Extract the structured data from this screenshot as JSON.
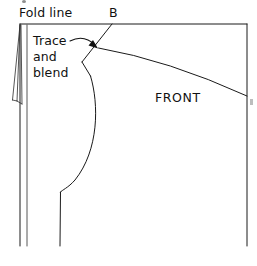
{
  "diagram": {
    "kind": "sewing-pattern-line-drawing",
    "canvas": {
      "width": 257,
      "height": 266,
      "background": "#ffffff"
    },
    "ink_color": "#1a1a1a"
  },
  "labels": {
    "fold_line": "Fold line",
    "point_b": "B",
    "trace_and_blend": "Trace\nand\nblend",
    "trace_and_blend_lines": [
      "Trace",
      "and",
      "blend"
    ],
    "front": "FRONT"
  },
  "annotations": {
    "arrow": {
      "name": "curved-arrow-to-point-b",
      "from": [
        70,
        41
      ],
      "to": [
        98,
        48
      ],
      "style": "curved-with-arrowhead"
    }
  },
  "geometry": {
    "top_edge": {
      "from": [
        20,
        24
      ],
      "to": [
        247,
        24
      ]
    },
    "right_edge": {
      "from": [
        247,
        24
      ],
      "to": [
        247,
        246
      ]
    },
    "fold_edge_outer": {
      "from": [
        20,
        24
      ],
      "to": [
        20,
        246
      ]
    },
    "fold_edge_inner": {
      "from": [
        27,
        24
      ],
      "to": [
        27,
        246
      ]
    },
    "dart_wedge": {
      "apex": [
        20,
        24
      ],
      "spread_bottom_left": [
        13,
        100
      ],
      "spread_bottom_right": [
        24,
        104
      ]
    },
    "point_b": [
      112,
      24
    ],
    "shoulder_seam": {
      "from": [
        112,
        24
      ],
      "to": [
        82,
        62
      ]
    },
    "neck_step": {
      "from": [
        82,
        62
      ],
      "to": [
        90,
        76
      ]
    },
    "armhole_curve": {
      "from": [
        99,
        48
      ],
      "control": [
        160,
        62
      ],
      "to": [
        247,
        96
      ]
    },
    "side_seam_curve": {
      "from": [
        90,
        76
      ],
      "bulge": [
        97,
        128
      ],
      "to": [
        60,
        192
      ]
    },
    "side_seam_straight": {
      "from": [
        60,
        192
      ],
      "to": [
        60,
        246
      ]
    }
  },
  "colors": {
    "ink": "#1a1a1a",
    "ink_light": "#2b2b2b",
    "paper": "#ffffff",
    "speck": "#b9b9b9"
  }
}
